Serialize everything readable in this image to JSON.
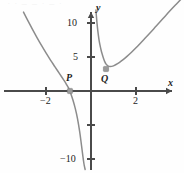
{
  "figure": {
    "title": "",
    "axes": {
      "x_label": "x",
      "y_label": "y"
    },
    "x_ticks": [
      {
        "value": -2,
        "label": "−2",
        "px": 46
      },
      {
        "value": 2,
        "label": "2",
        "px": 136
      }
    ],
    "y_ticks": [
      {
        "value": 10,
        "label": "10",
        "px": 23
      },
      {
        "value": 5,
        "label": "5",
        "px": 57
      },
      {
        "value": -5,
        "label": "",
        "px": 125
      },
      {
        "value": -10,
        "label": "−10",
        "px": 159
      }
    ],
    "points": [
      {
        "name": "P",
        "label": "P",
        "x": -0.95,
        "y": 0.0,
        "px": 70,
        "py": 91
      },
      {
        "name": "Q",
        "label": "Q",
        "x": 0.67,
        "y": 3.2,
        "px": 106,
        "py": 69
      }
    ],
    "colors": {
      "curve": "#8c8c8c",
      "axis": "#4a4a4a",
      "point": "#9a9a9a",
      "text": "#1c1c1c"
    },
    "ghost_text": {
      "top": "· ·   — —     ·   — ·"
    }
  },
  "chart_data": {
    "type": "line",
    "title": "",
    "xlabel": "x",
    "ylabel": "y",
    "xlim": [
      -3.3,
      4.1
    ],
    "ylim": [
      -11.5,
      12.0
    ],
    "grid": false,
    "legend": null,
    "annotations": [
      {
        "text": "P",
        "x": -0.95,
        "y": 0.0
      },
      {
        "text": "Q",
        "x": 0.67,
        "y": 3.2
      }
    ],
    "asymptote": {
      "type": "vertical",
      "x": 0
    },
    "series": [
      {
        "name": "left-branch",
        "comment": "x < 0 branch: falls from upper-left, crosses x-axis at P, plunges to -inf at x=0",
        "x": [
          -3.0,
          -2.8,
          -2.6,
          -2.4,
          -2.2,
          -2.0,
          -1.8,
          -1.6,
          -1.4,
          -1.2,
          -1.1,
          -1.0,
          -0.95,
          -0.9,
          -0.8,
          -0.7,
          -0.6,
          -0.5,
          -0.42,
          -0.36,
          -0.32,
          -0.29,
          -0.27,
          -0.26
        ],
        "y": [
          11.6,
          10.3,
          9.05,
          7.85,
          6.7,
          5.6,
          4.55,
          3.55,
          2.55,
          1.55,
          1.02,
          0.45,
          0.05,
          -0.35,
          -1.35,
          -2.55,
          -4.05,
          -6.05,
          -8.05,
          -9.6,
          -10.55,
          -11.1,
          -11.4,
          -11.55
        ]
      },
      {
        "name": "right-branch",
        "comment": "x > 0 branch: descends from +inf near x=0, minimum at Q(0.67, 3.2), rises to upper-right",
        "x": [
          0.22,
          0.25,
          0.28,
          0.32,
          0.36,
          0.4,
          0.45,
          0.5,
          0.55,
          0.6,
          0.67,
          0.75,
          0.85,
          1.0,
          1.2,
          1.4,
          1.6,
          1.8,
          2.0,
          2.3,
          2.6,
          2.9,
          3.2,
          3.5,
          3.8,
          4.0
        ],
        "y": [
          11.9,
          10.6,
          9.55,
          8.4,
          7.45,
          6.75,
          6.0,
          5.4,
          4.85,
          4.4,
          3.95,
          3.7,
          3.6,
          3.7,
          4.05,
          4.55,
          5.1,
          5.7,
          6.35,
          7.4,
          8.45,
          9.55,
          10.65,
          11.75,
          12.8,
          13.5
        ]
      }
    ]
  }
}
